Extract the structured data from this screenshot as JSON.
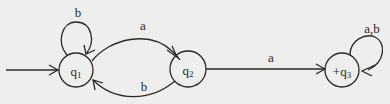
{
  "diagram": {
    "type": "finite-automaton",
    "colors": {
      "background": "#eeeeec",
      "stroke": "#2a2a2a",
      "text": "#2a2a2a"
    },
    "states": [
      {
        "id": "q1",
        "name": "q",
        "sub": "1",
        "prefix": "",
        "start": true,
        "final": false,
        "x": 76,
        "y": 70,
        "r": 17
      },
      {
        "id": "q2",
        "name": "q",
        "sub": "2",
        "prefix": "",
        "start": false,
        "final": false,
        "x": 188,
        "y": 69,
        "r": 18
      },
      {
        "id": "q3",
        "name": "q",
        "sub": "3",
        "prefix": "+",
        "start": false,
        "final": true,
        "x": 342,
        "y": 70,
        "r": 17
      }
    ],
    "transitions": [
      {
        "id": "q1-q1",
        "from": "q1",
        "to": "q1",
        "label": "b"
      },
      {
        "id": "q1-q2",
        "from": "q1",
        "to": "q2",
        "label": "a"
      },
      {
        "id": "q2-q1",
        "from": "q2",
        "to": "q1",
        "label": "b"
      },
      {
        "id": "q2-q3",
        "from": "q2",
        "to": "q3",
        "label": "a"
      },
      {
        "id": "q3-q3",
        "from": "q3",
        "to": "q3",
        "label": "a,b"
      }
    ]
  }
}
